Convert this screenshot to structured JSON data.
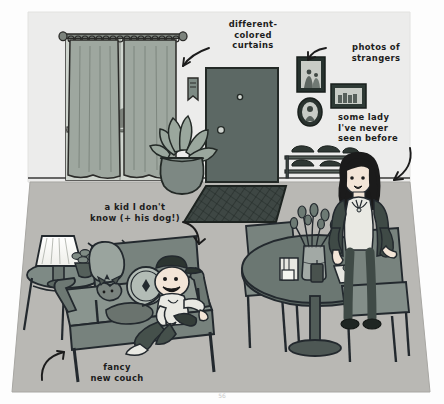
{
  "illustration": {
    "title": "Hand-drawn living room scene with handwritten annotations",
    "page_number": "56",
    "palette": {
      "paper": "#fdfdfd",
      "wall": "#e9e9e6",
      "floor": "#b9b9b6",
      "ink": "#1c1c1c",
      "door": "#5e6a66",
      "curtain": "#9aa39c",
      "couch": "#8e9a95",
      "table": "#6e7a76",
      "skin": "#f2e3d5",
      "hair": "#1c1c1c",
      "lampshade": "#fbfbf8"
    }
  },
  "annotations": [
    {
      "id": "different-colored-curtains",
      "text": "different-\ncolored\ncurtains",
      "points_to": "window-curtains"
    },
    {
      "id": "photos-of-strangers",
      "text": "photos of\nstrangers",
      "points_to": "picture-frames"
    },
    {
      "id": "some-lady",
      "text": "some lady\nI've never\nseen before",
      "points_to": "seated-woman"
    },
    {
      "id": "a-kid-i-dont-know",
      "text": "a kid I don't\nknow (+ his dog!)",
      "points_to": "kid-on-couch"
    },
    {
      "id": "fancy-new-couch",
      "text": "fancy\nnew couch",
      "points_to": "couch"
    }
  ],
  "scene_objects": [
    {
      "name": "window-with-curtains",
      "label": "Window with curtains on a rod with rings"
    },
    {
      "name": "front-door",
      "label": "Front door with knob and peephole"
    },
    {
      "name": "wall-sconce",
      "label": "Small wall hanging beside door"
    },
    {
      "name": "potted-plant",
      "label": "Large potted plant in urn"
    },
    {
      "name": "picture-frames",
      "label": "Three framed photographs on the wall"
    },
    {
      "name": "shoe-rack",
      "label": "Two-tier shoe rack with shoes"
    },
    {
      "name": "doormat",
      "label": "Diamond-patterned doormat"
    },
    {
      "name": "seated-woman",
      "label": "Woman seated at the dining table"
    },
    {
      "name": "dining-table",
      "label": "Round dining table"
    },
    {
      "name": "vase-of-flowers",
      "label": "Vase of flowers on the table"
    },
    {
      "name": "napkin-holder",
      "label": "Napkin holder with books"
    },
    {
      "name": "candle",
      "label": "Candle on the table"
    },
    {
      "name": "food-tray",
      "label": "Tray of food"
    },
    {
      "name": "dining-chairs",
      "label": "Two dining chairs"
    },
    {
      "name": "couch",
      "label": "Couch with two cushions"
    },
    {
      "name": "kid-on-couch",
      "label": "Kid wearing a cap holding a game controller"
    },
    {
      "name": "dog-on-couch",
      "label": "Dog lying on the couch"
    },
    {
      "name": "side-table",
      "label": "Round side table"
    },
    {
      "name": "table-lamp",
      "label": "Table lamp with pleated shade"
    },
    {
      "name": "small-succulent",
      "label": "Small potted succulent"
    }
  ]
}
